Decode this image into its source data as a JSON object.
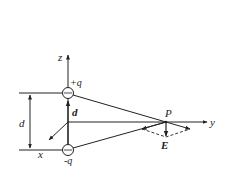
{
  "diagram": {
    "axes": {
      "z": "z",
      "y": "y",
      "x": "x"
    },
    "charges": {
      "positive": "+q",
      "negative": "-q"
    },
    "labels": {
      "separation": "d",
      "dipole_vector": "d",
      "point": "P",
      "field": "E"
    },
    "colors": {
      "stroke": "#222222",
      "background": "#ffffff"
    }
  }
}
